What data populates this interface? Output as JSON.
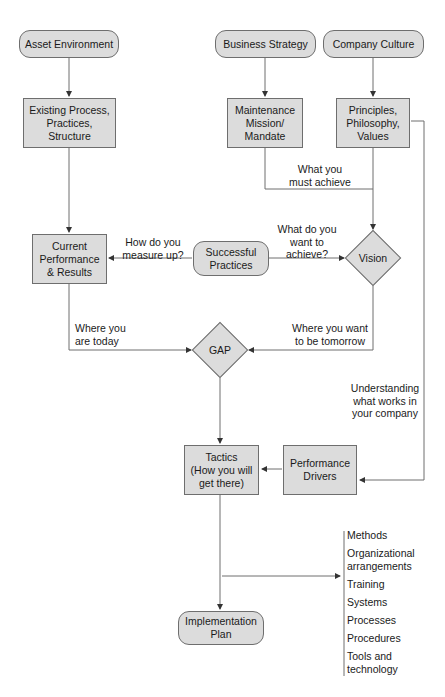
{
  "diagram": {
    "nodes": {
      "asset_environment": "Asset Environment",
      "business_strategy": "Business Strategy",
      "company_culture": "Company Culture",
      "existing_process": "Existing Process,\nPractices,\nStructure",
      "maintenance_mission": "Maintenance\nMission/\nMandate",
      "principles": "Principles,\nPhilosophy,\nValues",
      "current_performance": "Current\nPerformance\n& Results",
      "successful_practices": "Successful\nPractices",
      "vision": "Vision",
      "gap": "GAP",
      "tactics": "Tactics\n(How you will\nget there)",
      "performance_drivers": "Performance\nDrivers",
      "implementation_plan": "Implementation\nPlan"
    },
    "edge_labels": {
      "must_achieve": "What you\nmust achieve",
      "measure_up": "How do you\nmeasure up?",
      "want_to_achieve": "What do you\nwant to\nachieve?",
      "where_today": "Where you\nare today",
      "where_tomorrow": "Where you want\nto be tomorrow",
      "understanding": "Understanding\nwhat works in\nyour company"
    },
    "tactics_list": [
      "Methods",
      "Organizational\narrangements",
      "Training",
      "Systems",
      "Processes",
      "Procedures",
      "Tools and\ntechnology"
    ],
    "colors": {
      "node_fill": "#dcdcdc",
      "stroke": "#6e6e6e"
    }
  }
}
